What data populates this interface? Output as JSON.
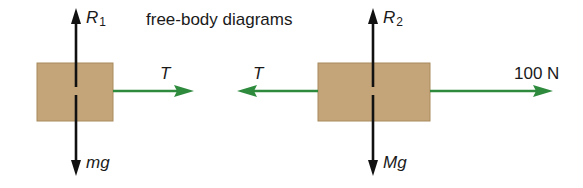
{
  "title": "free-body diagrams",
  "colors": {
    "block_fill": "#c4a57a",
    "block_border": "#a88a5c",
    "force_black": "#111111",
    "force_green": "#2e8b3e"
  },
  "bodies": [
    {
      "id": "block-1",
      "forces": {
        "up": {
          "symbol": "R",
          "subscript": "1"
        },
        "down": {
          "symbol": "mg"
        },
        "right": {
          "symbol": "T"
        }
      }
    },
    {
      "id": "block-2",
      "forces": {
        "up": {
          "symbol": "R",
          "subscript": "2"
        },
        "down": {
          "symbol": "Mg"
        },
        "left": {
          "symbol": "T"
        },
        "right": {
          "label": "100 N"
        }
      }
    }
  ]
}
